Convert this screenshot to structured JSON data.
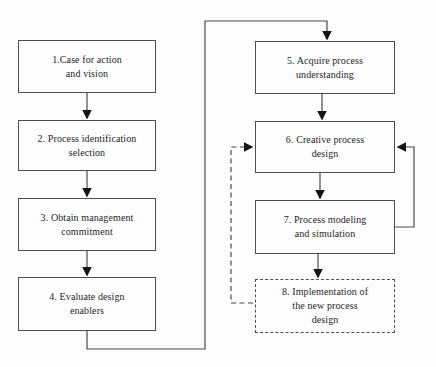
{
  "diagram": {
    "type": "flowchart",
    "steps": [
      {
        "number": "1",
        "text": "1.Case for action and vision",
        "lines": [
          "1.Case for action",
          "and vision"
        ],
        "border": "solid"
      },
      {
        "number": "2",
        "text": "2. Process identification selection",
        "lines": [
          "2. Process identification",
          "selection"
        ],
        "border": "solid"
      },
      {
        "number": "3",
        "text": "3. Obtain management commitment",
        "lines": [
          "3. Obtain management",
          "commitment"
        ],
        "border": "solid"
      },
      {
        "number": "4",
        "text": "4. Evaluate design enablers",
        "lines": [
          "4. Evaluate design",
          "enablers"
        ],
        "border": "solid"
      },
      {
        "number": "5",
        "text": "5. Acquire process understanding",
        "lines": [
          "5. Acquire process",
          "understanding"
        ],
        "border": "solid"
      },
      {
        "number": "6",
        "text": "6. Creative process design",
        "lines": [
          "6. Creative process",
          "design"
        ],
        "border": "solid"
      },
      {
        "number": "7",
        "text": "7. Process modeling and simulation",
        "lines": [
          "7. Process modeling",
          "and simulation"
        ],
        "border": "solid"
      },
      {
        "number": "8",
        "text": "8. Implementation of the new process design",
        "lines": [
          "8. Implementation of",
          "the new process",
          "design"
        ],
        "border": "dashed"
      }
    ],
    "connections": [
      {
        "from": "1",
        "to": "2",
        "style": "solid-arrow"
      },
      {
        "from": "2",
        "to": "3",
        "style": "solid-arrow"
      },
      {
        "from": "3",
        "to": "4",
        "style": "solid-arrow"
      },
      {
        "from": "4",
        "to": "5",
        "style": "solid-arrow-routed"
      },
      {
        "from": "5",
        "to": "6",
        "style": "solid-arrow"
      },
      {
        "from": "6",
        "to": "7",
        "style": "solid-arrow"
      },
      {
        "from": "7",
        "to": "8",
        "style": "solid-arrow"
      },
      {
        "from": "7",
        "to": "6",
        "style": "solid-arrow-feedback"
      },
      {
        "from": "8",
        "to": "6",
        "style": "dashed-arrow-feedback"
      }
    ]
  },
  "colors": {
    "bg": "#fdfdfd",
    "line": "#4a4a4a",
    "arrow": "#151515",
    "box-border": "#4d4d4d",
    "text": "#262626"
  }
}
